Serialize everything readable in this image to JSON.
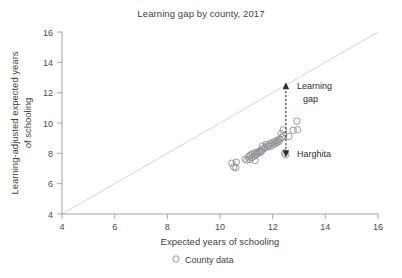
{
  "chart_data": {
    "type": "scatter",
    "title": "Learning gap by county, 2017",
    "xlabel": "Expected years of schooling",
    "ylabel": "Learning-adjusted expected years of schooling",
    "xlim": [
      4,
      16
    ],
    "ylim": [
      4,
      16
    ],
    "xticks": [
      4,
      6,
      8,
      10,
      12,
      14,
      16
    ],
    "yticks": [
      4,
      6,
      8,
      10,
      12,
      14,
      16
    ],
    "grid": false,
    "legend": {
      "position": "bottom-center",
      "entries": [
        {
          "label": "County data",
          "marker": "open-circle",
          "color": "#8e8e96"
        }
      ]
    },
    "reference_line": {
      "name": "parity-line",
      "description": "y = x diagonal",
      "from": [
        4,
        4
      ],
      "to": [
        16,
        16
      ],
      "color": "#cfcfcf"
    },
    "series": [
      {
        "name": "County data",
        "marker": "open-circle",
        "color": "#8e8e96",
        "points": [
          [
            10.45,
            7.35
          ],
          [
            10.52,
            7.1
          ],
          [
            10.62,
            7.42
          ],
          [
            10.6,
            7.05
          ],
          [
            10.95,
            7.62
          ],
          [
            11.02,
            7.55
          ],
          [
            11.08,
            7.78
          ],
          [
            11.12,
            7.6
          ],
          [
            11.15,
            7.88
          ],
          [
            11.2,
            7.7
          ],
          [
            11.22,
            7.95
          ],
          [
            11.28,
            7.8
          ],
          [
            11.3,
            8.02
          ],
          [
            11.33,
            7.52
          ],
          [
            11.36,
            7.9
          ],
          [
            11.4,
            8.08
          ],
          [
            11.44,
            7.98
          ],
          [
            11.48,
            8.12
          ],
          [
            11.52,
            8.05
          ],
          [
            11.55,
            8.2
          ],
          [
            11.58,
            8.15
          ],
          [
            11.62,
            8.48
          ],
          [
            11.66,
            8.3
          ],
          [
            11.7,
            8.38
          ],
          [
            11.75,
            8.58
          ],
          [
            11.8,
            8.42
          ],
          [
            11.84,
            8.5
          ],
          [
            11.88,
            8.62
          ],
          [
            11.92,
            8.46
          ],
          [
            11.96,
            8.7
          ],
          [
            12.0,
            8.55
          ],
          [
            12.04,
            8.75
          ],
          [
            12.08,
            8.62
          ],
          [
            12.12,
            8.82
          ],
          [
            12.16,
            8.7
          ],
          [
            12.2,
            8.88
          ],
          [
            12.24,
            8.78
          ],
          [
            12.28,
            8.95
          ],
          [
            12.32,
            9.3
          ],
          [
            12.36,
            9.05
          ],
          [
            12.4,
            9.55
          ],
          [
            12.42,
            9.18
          ],
          [
            12.45,
            8.02
          ],
          [
            12.5,
            7.92
          ],
          [
            12.62,
            9.12
          ],
          [
            12.78,
            9.52
          ],
          [
            12.92,
            10.12
          ],
          [
            12.95,
            9.55
          ]
        ]
      }
    ],
    "annotations": [
      {
        "name": "learning-gap",
        "label_line1": "Learning",
        "label_line2": "gap",
        "arrow": {
          "x": 12.45,
          "y_bottom": 8.0,
          "y_top": 12.4,
          "style": "dashed-double-arrow"
        }
      },
      {
        "name": "harghita-point",
        "label": "Harghita",
        "point": [
          12.45,
          8.0
        ]
      }
    ]
  },
  "legend_text": {
    "county_data": "County data"
  }
}
